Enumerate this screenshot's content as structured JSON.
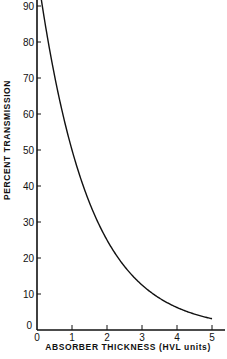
{
  "chart_data": {
    "type": "line",
    "title": "",
    "xlabel": "ABSORBER THICKNESS (HVL units)",
    "ylabel": "PERCENT TRANSMISSION",
    "xlim": [
      0,
      5.3
    ],
    "ylim": [
      0,
      90
    ],
    "x_ticks": [
      0,
      1,
      2,
      3,
      4,
      5
    ],
    "y_ticks": [
      0,
      10,
      20,
      30,
      40,
      50,
      60,
      70,
      80,
      90
    ],
    "grid": false,
    "legend": null,
    "series": [
      {
        "name": "transmission",
        "x": [
          0,
          0.25,
          0.5,
          0.75,
          1,
          1.5,
          2,
          2.5,
          3,
          3.5,
          4,
          4.5,
          5
        ],
        "values": [
          100,
          84.1,
          70.7,
          59.5,
          50,
          35.4,
          25,
          17.7,
          12.5,
          8.8,
          6.25,
          4.4,
          3.1
        ]
      }
    ]
  },
  "labels": {
    "x_axis": "ABSORBER THICKNESS (HVL units)",
    "y_axis": "PERCENT TRANSMISSION"
  }
}
